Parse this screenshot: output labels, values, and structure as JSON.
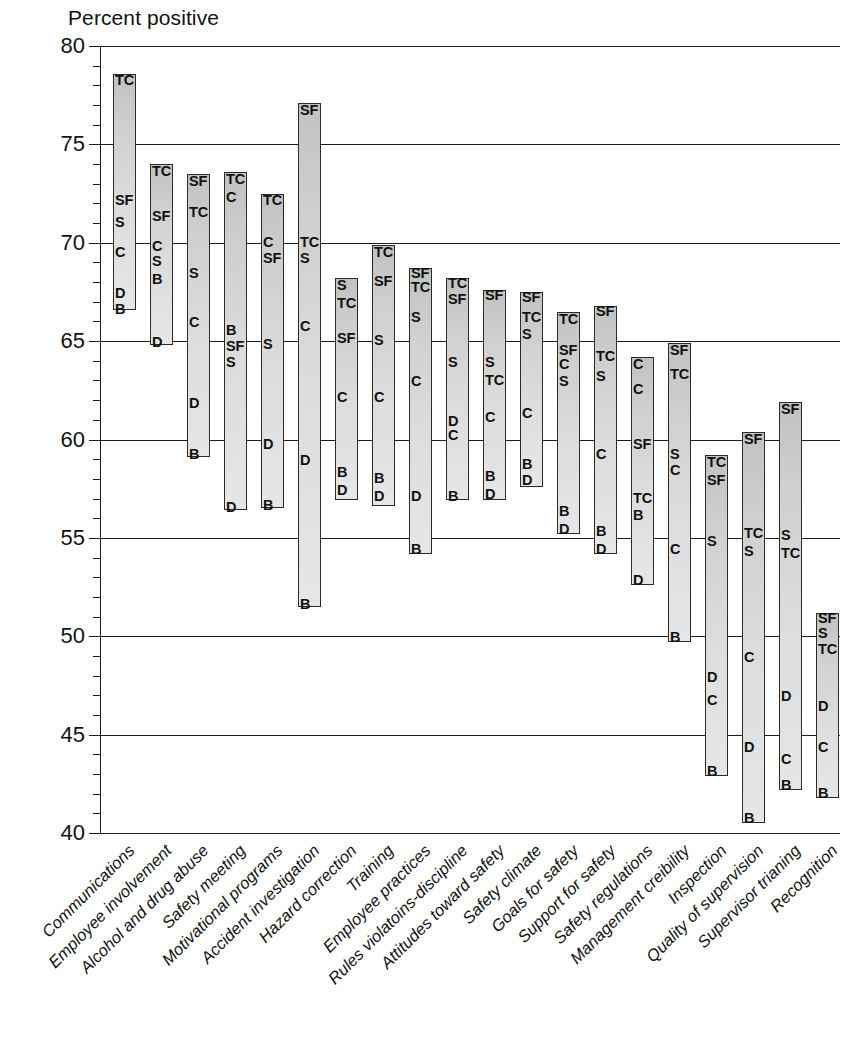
{
  "chart_data": {
    "type": "bar",
    "title": "",
    "ylabel": "Percent positive",
    "xlabel": "",
    "ylim": [
      40,
      80
    ],
    "ytick_step": 5,
    "yminor_step": 1,
    "yticks": [
      "40",
      "45",
      "50",
      "55",
      "60",
      "65",
      "70",
      "75",
      "80"
    ],
    "grid": "horizontal",
    "legend": "none",
    "bar_style": "range-bar-with-point-labels",
    "point_codes": [
      "TC",
      "SF",
      "S",
      "C",
      "D",
      "B"
    ],
    "categories": [
      "Communications",
      "Employee involvement",
      "Alcohol and drug abuse",
      "Safety meeting",
      "Motivational programs",
      "Accident investigation",
      "Hazard correction",
      "Training",
      "Employee practices",
      "Rules violatoins-discipline",
      "Attitudes toward safety",
      "Safety climate",
      "Goals for safety",
      "Support for safety",
      "Safety regulations",
      "Management creibility",
      "Inspection",
      "Quality of supervision",
      "Supervisor trianing",
      "Recognition"
    ],
    "bars": [
      {
        "category": "Communications",
        "top": 78.6,
        "bottom": 66.6,
        "points": [
          {
            "code": "TC",
            "value": 78.3
          },
          {
            "code": "SF",
            "value": 72.2
          },
          {
            "code": "S",
            "value": 71.1
          },
          {
            "code": "C",
            "value": 69.6
          },
          {
            "code": "D",
            "value": 67.5
          },
          {
            "code": "B",
            "value": 66.7
          }
        ]
      },
      {
        "category": "Employee involvement",
        "top": 74.0,
        "bottom": 64.8,
        "points": [
          {
            "code": "TC",
            "value": 73.7
          },
          {
            "code": "SF",
            "value": 71.4
          },
          {
            "code": "C",
            "value": 69.9
          },
          {
            "code": "S",
            "value": 69.1
          },
          {
            "code": "B",
            "value": 68.2
          },
          {
            "code": "D",
            "value": 65.0
          }
        ]
      },
      {
        "category": "Alcohol and drug abuse",
        "top": 73.5,
        "bottom": 59.1,
        "points": [
          {
            "code": "SF",
            "value": 73.2
          },
          {
            "code": "TC",
            "value": 71.6
          },
          {
            "code": "S",
            "value": 68.5
          },
          {
            "code": "C",
            "value": 66.0
          },
          {
            "code": "D",
            "value": 61.9
          },
          {
            "code": "B",
            "value": 59.3
          }
        ]
      },
      {
        "category": "Safety meeting",
        "top": 73.6,
        "bottom": 56.4,
        "points": [
          {
            "code": "TC",
            "value": 73.3
          },
          {
            "code": "C",
            "value": 72.4
          },
          {
            "code": "B",
            "value": 65.6
          },
          {
            "code": "SF",
            "value": 64.8
          },
          {
            "code": "S",
            "value": 64.0
          },
          {
            "code": "D",
            "value": 56.6
          }
        ]
      },
      {
        "category": "Motivational programs",
        "top": 72.5,
        "bottom": 56.5,
        "points": [
          {
            "code": "TC",
            "value": 72.2
          },
          {
            "code": "C",
            "value": 70.1
          },
          {
            "code": "SF",
            "value": 69.3
          },
          {
            "code": "S",
            "value": 64.9
          },
          {
            "code": "D",
            "value": 59.8
          },
          {
            "code": "B",
            "value": 56.7
          }
        ]
      },
      {
        "category": "Accident investigation",
        "top": 77.1,
        "bottom": 51.5,
        "points": [
          {
            "code": "SF",
            "value": 76.8
          },
          {
            "code": "TC",
            "value": 70.1
          },
          {
            "code": "S",
            "value": 69.3
          },
          {
            "code": "C",
            "value": 65.8
          },
          {
            "code": "D",
            "value": 59.0
          },
          {
            "code": "B",
            "value": 51.7
          }
        ]
      },
      {
        "category": "Hazard correction",
        "top": 68.2,
        "bottom": 56.9,
        "points": [
          {
            "code": "S",
            "value": 67.9
          },
          {
            "code": "TC",
            "value": 67.0
          },
          {
            "code": "SF",
            "value": 65.2
          },
          {
            "code": "C",
            "value": 62.2
          },
          {
            "code": "B",
            "value": 58.4
          },
          {
            "code": "D",
            "value": 57.5
          }
        ]
      },
      {
        "category": "Training",
        "top": 69.9,
        "bottom": 56.6,
        "points": [
          {
            "code": "TC",
            "value": 69.6
          },
          {
            "code": "SF",
            "value": 68.1
          },
          {
            "code": "S",
            "value": 65.1
          },
          {
            "code": "C",
            "value": 62.2
          },
          {
            "code": "B",
            "value": 58.1
          },
          {
            "code": "D",
            "value": 57.2
          }
        ]
      },
      {
        "category": "Employee practices",
        "top": 68.7,
        "bottom": 54.2,
        "points": [
          {
            "code": "SF",
            "value": 68.5
          },
          {
            "code": "TC",
            "value": 67.8
          },
          {
            "code": "S",
            "value": 66.3
          },
          {
            "code": "C",
            "value": 63.0
          },
          {
            "code": "D",
            "value": 57.2
          },
          {
            "code": "B",
            "value": 54.5
          }
        ]
      },
      {
        "category": "Rules violatoins-discipline",
        "top": 68.2,
        "bottom": 56.9,
        "points": [
          {
            "code": "TC",
            "value": 68.0
          },
          {
            "code": "SF",
            "value": 67.2
          },
          {
            "code": "S",
            "value": 64.0
          },
          {
            "code": "D",
            "value": 61.0
          },
          {
            "code": "C",
            "value": 60.3
          },
          {
            "code": "B",
            "value": 57.2
          }
        ]
      },
      {
        "category": "Attitudes toward safety",
        "top": 67.6,
        "bottom": 56.9,
        "points": [
          {
            "code": "SF",
            "value": 67.4
          },
          {
            "code": "S",
            "value": 64.0
          },
          {
            "code": "TC",
            "value": 63.1
          },
          {
            "code": "C",
            "value": 61.2
          },
          {
            "code": "B",
            "value": 58.2
          },
          {
            "code": "D",
            "value": 57.3
          }
        ]
      },
      {
        "category": "Safety climate",
        "top": 67.5,
        "bottom": 57.6,
        "points": [
          {
            "code": "SF",
            "value": 67.3
          },
          {
            "code": "TC",
            "value": 66.3
          },
          {
            "code": "S",
            "value": 65.4
          },
          {
            "code": "C",
            "value": 61.4
          },
          {
            "code": "B",
            "value": 58.8
          },
          {
            "code": "D",
            "value": 58.0
          }
        ]
      },
      {
        "category": "Goals for safety",
        "top": 66.5,
        "bottom": 55.2,
        "points": [
          {
            "code": "TC",
            "value": 66.2
          },
          {
            "code": "SF",
            "value": 64.6
          },
          {
            "code": "C",
            "value": 63.9
          },
          {
            "code": "S",
            "value": 63.0
          },
          {
            "code": "B",
            "value": 56.4
          },
          {
            "code": "D",
            "value": 55.5
          }
        ]
      },
      {
        "category": "Support for safety",
        "top": 66.8,
        "bottom": 54.2,
        "points": [
          {
            "code": "SF",
            "value": 66.6
          },
          {
            "code": "TC",
            "value": 64.3
          },
          {
            "code": "S",
            "value": 63.3
          },
          {
            "code": "C",
            "value": 59.3
          },
          {
            "code": "B",
            "value": 55.4
          },
          {
            "code": "D",
            "value": 54.5
          }
        ]
      },
      {
        "category": "Safety regulations",
        "top": 64.2,
        "bottom": 52.6,
        "points": [
          {
            "code": "C",
            "value": 63.9
          },
          {
            "code": "C2",
            "value": 62.6
          },
          {
            "code": "SF",
            "value": 59.8
          },
          {
            "code": "TC",
            "value": 57.1
          },
          {
            "code": "B",
            "value": 56.2
          },
          {
            "code": "D",
            "value": 52.9
          }
        ]
      },
      {
        "category": "Management creibility",
        "top": 64.9,
        "bottom": 49.7,
        "points": [
          {
            "code": "SF",
            "value": 64.6
          },
          {
            "code": "TC",
            "value": 63.4
          },
          {
            "code": "S",
            "value": 59.3
          },
          {
            "code": "C",
            "value": 58.5
          },
          {
            "code": "C2",
            "value": 54.5
          },
          {
            "code": "B",
            "value": 50.0
          }
        ]
      },
      {
        "category": "Inspection",
        "top": 59.2,
        "bottom": 42.9,
        "points": [
          {
            "code": "TC",
            "value": 58.9
          },
          {
            "code": "SF",
            "value": 58.0
          },
          {
            "code": "S",
            "value": 54.9
          },
          {
            "code": "D",
            "value": 48.0
          },
          {
            "code": "C",
            "value": 46.8
          },
          {
            "code": "B",
            "value": 43.2
          }
        ]
      },
      {
        "category": "Quality of supervision",
        "top": 60.4,
        "bottom": 40.5,
        "points": [
          {
            "code": "SF",
            "value": 60.1
          },
          {
            "code": "TC",
            "value": 55.3
          },
          {
            "code": "S",
            "value": 54.4
          },
          {
            "code": "C",
            "value": 49.0
          },
          {
            "code": "D",
            "value": 44.4
          },
          {
            "code": "B",
            "value": 40.8
          }
        ]
      },
      {
        "category": "Supervisor trianing",
        "top": 61.9,
        "bottom": 42.2,
        "points": [
          {
            "code": "SF",
            "value": 61.6
          },
          {
            "code": "S",
            "value": 55.2
          },
          {
            "code": "TC",
            "value": 54.3
          },
          {
            "code": "D",
            "value": 47.0
          },
          {
            "code": "C",
            "value": 43.8
          },
          {
            "code": "B",
            "value": 42.5
          }
        ]
      },
      {
        "category": "Recognition",
        "top": 51.2,
        "bottom": 41.8,
        "points": [
          {
            "code": "SF",
            "value": 51.0
          },
          {
            "code": "S",
            "value": 50.2
          },
          {
            "code": "TC",
            "value": 49.4
          },
          {
            "code": "D",
            "value": 46.5
          },
          {
            "code": "C",
            "value": 44.4
          },
          {
            "code": "B",
            "value": 42.1
          }
        ]
      }
    ]
  }
}
